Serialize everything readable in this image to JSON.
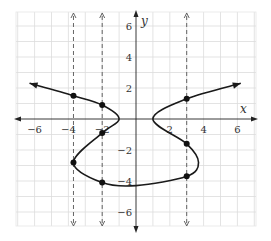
{
  "chart_data": {
    "type": "line",
    "title": "",
    "xlabel": "x",
    "ylabel": "y",
    "xlim": [
      -7,
      7
    ],
    "ylim": [
      -7,
      7
    ],
    "grid": true,
    "x_ticks": [
      -6,
      -4,
      -2,
      2,
      4,
      6
    ],
    "y_ticks": [
      6,
      4,
      2,
      -2,
      -4,
      -6
    ],
    "tick_labels_x": [
      "−6",
      "−4",
      "−2",
      "2",
      "4",
      "6"
    ],
    "tick_labels_y": [
      "6",
      "4",
      "2",
      "−2",
      "−4",
      "−6"
    ],
    "vertical_dashed_lines": [
      -3.7,
      -2,
      3
    ],
    "series": [
      {
        "name": "curve",
        "style": "smooth, arrows at both ends",
        "points": [
          [
            -6.3,
            2.3
          ],
          [
            -3.7,
            1.5
          ],
          [
            -2,
            0.9
          ],
          [
            -1.0,
            0
          ],
          [
            -2,
            -0.9
          ],
          [
            -3.7,
            -2.8
          ],
          [
            -2,
            -4.1
          ],
          [
            0,
            -4.3
          ],
          [
            3,
            -3.7
          ],
          [
            3.7,
            -2.8
          ],
          [
            3,
            -1.6
          ],
          [
            1.0,
            0
          ],
          [
            3,
            1.3
          ],
          [
            6.2,
            2.3
          ]
        ]
      }
    ],
    "marked_points": [
      [
        -3.7,
        1.5
      ],
      [
        -2,
        0.9
      ],
      [
        -2,
        -0.9
      ],
      [
        -3.7,
        -2.8
      ],
      [
        -2,
        -4.1
      ],
      [
        3,
        1.3
      ],
      [
        3,
        -1.6
      ],
      [
        3,
        -3.7
      ]
    ]
  }
}
